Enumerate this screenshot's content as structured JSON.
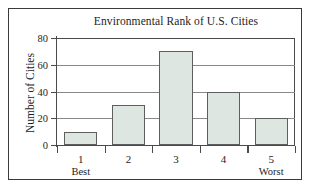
{
  "chart_data": {
    "type": "bar",
    "title": "Environmental Rank of U.S. Cities",
    "xlabel": "",
    "ylabel": "Number of Cities",
    "categories": [
      "1",
      "2",
      "3",
      "4",
      "5"
    ],
    "category_notes": [
      "Best",
      "",
      "",
      "",
      "Worst"
    ],
    "values": [
      10,
      30,
      70,
      40,
      20
    ],
    "ylim": [
      0,
      80
    ],
    "yticks": [
      0,
      20,
      40,
      60,
      80
    ],
    "ytick_labels": [
      "0",
      "20",
      "40",
      "60",
      "80"
    ],
    "grid": "horizontal",
    "legend": "none",
    "bar_fill_color": "#dde6e1",
    "bar_edge_color": "#5e5e5e",
    "axis_color": "#4a4a4a",
    "grid_color": "#888888",
    "text_color": "#1d1d1d",
    "background_color": "#ffffff"
  }
}
